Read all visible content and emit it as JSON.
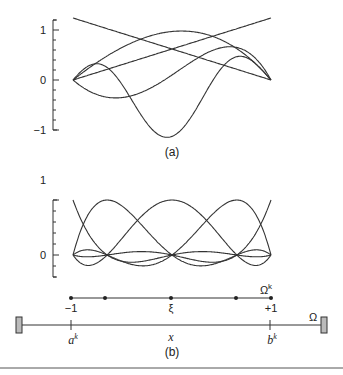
{
  "figure": {
    "panel_a": {
      "label": "(a)",
      "y_ticks": [
        "1",
        "0",
        "−1"
      ]
    },
    "panel_b": {
      "label": "(b)",
      "y_ticks": [
        "1",
        "0"
      ],
      "element_labels": {
        "left": "−1",
        "center": "ξ",
        "right": "+1",
        "element": "Ω",
        "element_sup": "k"
      },
      "domain_labels": {
        "a": "a",
        "a_sup": "k",
        "x": "x",
        "b": "b",
        "b_sup": "k",
        "domain": "Ω"
      }
    }
  },
  "chart_data": [
    {
      "type": "line",
      "title": "(a) Modal basis functions",
      "xlabel": "",
      "ylabel": "",
      "xlim": [
        -1,
        1
      ],
      "ylim": [
        -1,
        1.2
      ],
      "y_ticks": [
        -1,
        0,
        1
      ],
      "series": [
        {
          "name": "linear-decreasing",
          "x": [
            -1,
            1
          ],
          "y": [
            1.24,
            0
          ]
        },
        {
          "name": "linear-increasing",
          "x": [
            -1,
            1
          ],
          "y": [
            0,
            1.24
          ]
        },
        {
          "name": "bubble-2",
          "x": [
            -1,
            -0.5,
            0,
            0.5,
            1
          ],
          "y": [
            0,
            0.7,
            0.95,
            0.7,
            0
          ]
        },
        {
          "name": "bubble-3",
          "x": [
            -1,
            -0.6,
            0,
            0.6,
            1
          ],
          "y": [
            0,
            -0.8,
            -0.4,
            0.9,
            0
          ]
        },
        {
          "name": "bubble-4",
          "x": [
            -1,
            -0.75,
            -0.25,
            0.25,
            0.75,
            1
          ],
          "y": [
            0,
            0.85,
            -0.3,
            -1.0,
            0.85,
            0
          ]
        }
      ]
    },
    {
      "type": "line",
      "title": "(b) Nodal (Lagrange) basis functions on 5 GLL points",
      "xlabel": "",
      "ylabel": "",
      "xlim": [
        -1,
        1
      ],
      "ylim": [
        -0.4,
        1
      ],
      "y_ticks": [
        0,
        1
      ],
      "nodes": [
        -1,
        -0.6547,
        0,
        0.6547,
        1
      ],
      "series": [
        {
          "name": "h0",
          "peak_at": -1
        },
        {
          "name": "h1",
          "peak_at": -0.6547
        },
        {
          "name": "h2",
          "peak_at": 0
        },
        {
          "name": "h3",
          "peak_at": 0.6547
        },
        {
          "name": "h4",
          "peak_at": 1
        }
      ]
    }
  ]
}
